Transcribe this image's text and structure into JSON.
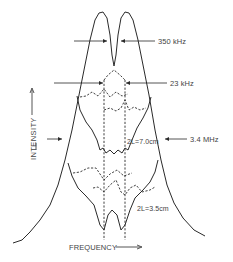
{
  "figure": {
    "type": "spectral line profile diagram",
    "axes": {
      "y_label": "INTENSITY",
      "x_label": "FREQUENCY"
    },
    "annotations": {
      "outer_split": "350 kHz",
      "inner_split": "23 kHz",
      "outer_width": "3.4 MHz",
      "cavity_upper": "2L=7.0cm",
      "cavity_lower": "2L=3.5cm"
    },
    "colors": {
      "ink": "#2a2a2a",
      "text": "#444444",
      "background": "#ffffff"
    }
  }
}
